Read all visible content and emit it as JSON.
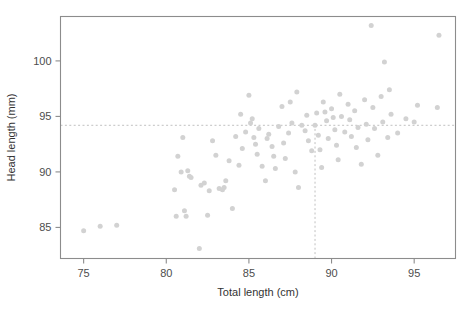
{
  "chart_data": {
    "type": "scatter",
    "title": "",
    "xlabel": "Total length (cm)",
    "ylabel": "Head length (mm)",
    "xlim": [
      73.6,
      97.5
    ],
    "ylim": [
      82.2,
      104.0
    ],
    "xticks": [
      75,
      80,
      85,
      90,
      95
    ],
    "yticks": [
      85,
      90,
      95,
      100
    ],
    "xticklabels": [
      "75",
      "80",
      "85",
      "90",
      "95"
    ],
    "yticklabels": [
      "85",
      "90",
      "95",
      "100"
    ],
    "grid": false,
    "legend": null,
    "marker": {
      "color": "#d2d2d2",
      "size": 5,
      "shape": "circle"
    },
    "annotations": [
      {
        "name": "horizontal-reference-line",
        "orientation": "horizontal",
        "value": 94.2,
        "style": "dashed",
        "color": "#c0c0c0"
      },
      {
        "name": "vertical-reference-line",
        "orientation": "vertical",
        "value": 89.0,
        "style": "dashed",
        "color": "#c0c0c0"
      }
    ],
    "n_points": 104,
    "points": [
      [
        75.0,
        84.7
      ],
      [
        76.0,
        85.1
      ],
      [
        77.0,
        85.2
      ],
      [
        80.5,
        88.4
      ],
      [
        80.6,
        86.0
      ],
      [
        80.7,
        91.4
      ],
      [
        80.9,
        90.0
      ],
      [
        81.0,
        93.1
      ],
      [
        81.1,
        86.5
      ],
      [
        81.2,
        86.0
      ],
      [
        81.3,
        90.1
      ],
      [
        81.4,
        89.6
      ],
      [
        81.5,
        89.5
      ],
      [
        82.0,
        83.1
      ],
      [
        82.1,
        88.8
      ],
      [
        82.3,
        89.0
      ],
      [
        82.5,
        86.1
      ],
      [
        82.6,
        88.3
      ],
      [
        82.8,
        92.8
      ],
      [
        83.0,
        91.5
      ],
      [
        83.2,
        88.5
      ],
      [
        83.4,
        88.4
      ],
      [
        83.5,
        88.6
      ],
      [
        83.6,
        89.2
      ],
      [
        83.8,
        91.0
      ],
      [
        84.0,
        86.7
      ],
      [
        84.2,
        93.2
      ],
      [
        84.4,
        90.6
      ],
      [
        84.5,
        95.2
      ],
      [
        84.6,
        92.1
      ],
      [
        84.8,
        93.6
      ],
      [
        85.0,
        96.9
      ],
      [
        85.1,
        94.4
      ],
      [
        85.2,
        94.8
      ],
      [
        85.3,
        93.1
      ],
      [
        85.4,
        92.5
      ],
      [
        85.5,
        91.6
      ],
      [
        85.6,
        93.9
      ],
      [
        85.8,
        90.5
      ],
      [
        86.0,
        89.2
      ],
      [
        86.1,
        93.0
      ],
      [
        86.2,
        93.4
      ],
      [
        86.4,
        92.3
      ],
      [
        86.5,
        91.4
      ],
      [
        86.6,
        90.3
      ],
      [
        86.8,
        94.1
      ],
      [
        87.0,
        95.9
      ],
      [
        87.1,
        92.6
      ],
      [
        87.2,
        91.2
      ],
      [
        87.4,
        93.5
      ],
      [
        87.5,
        96.3
      ],
      [
        87.6,
        94.4
      ],
      [
        87.8,
        90.0
      ],
      [
        88.0,
        88.6
      ],
      [
        88.2,
        94.2
      ],
      [
        88.4,
        93.7
      ],
      [
        88.5,
        95.1
      ],
      [
        88.6,
        92.8
      ],
      [
        88.8,
        91.9
      ],
      [
        89.0,
        94.2
      ],
      [
        89.1,
        95.3
      ],
      [
        89.2,
        93.3
      ],
      [
        89.3,
        92.0
      ],
      [
        89.4,
        90.4
      ],
      [
        89.5,
        96.3
      ],
      [
        89.6,
        95.4
      ],
      [
        89.7,
        94.6
      ],
      [
        89.8,
        93.0
      ],
      [
        90.0,
        95.7
      ],
      [
        90.1,
        94.9
      ],
      [
        90.2,
        93.8
      ],
      [
        90.3,
        92.4
      ],
      [
        90.4,
        91.1
      ],
      [
        90.5,
        97.0
      ],
      [
        90.6,
        95.0
      ],
      [
        90.8,
        93.6
      ],
      [
        91.0,
        96.1
      ],
      [
        91.1,
        94.7
      ],
      [
        91.2,
        93.2
      ],
      [
        91.4,
        95.5
      ],
      [
        91.5,
        92.2
      ],
      [
        91.6,
        94.0
      ],
      [
        91.8,
        90.7
      ],
      [
        92.0,
        96.5
      ],
      [
        92.1,
        94.3
      ],
      [
        92.2,
        92.9
      ],
      [
        92.4,
        103.2
      ],
      [
        92.5,
        95.8
      ],
      [
        92.6,
        93.9
      ],
      [
        92.8,
        91.5
      ],
      [
        93.0,
        96.8
      ],
      [
        93.1,
        94.5
      ],
      [
        93.2,
        99.9
      ],
      [
        93.4,
        93.1
      ],
      [
        93.5,
        97.4
      ],
      [
        93.6,
        95.2
      ],
      [
        94.0,
        93.5
      ],
      [
        94.5,
        94.8
      ],
      [
        95.0,
        94.5
      ],
      [
        95.2,
        96.0
      ],
      [
        96.4,
        95.8
      ],
      [
        96.5,
        102.3
      ],
      [
        87.9,
        97.2
      ]
    ]
  }
}
